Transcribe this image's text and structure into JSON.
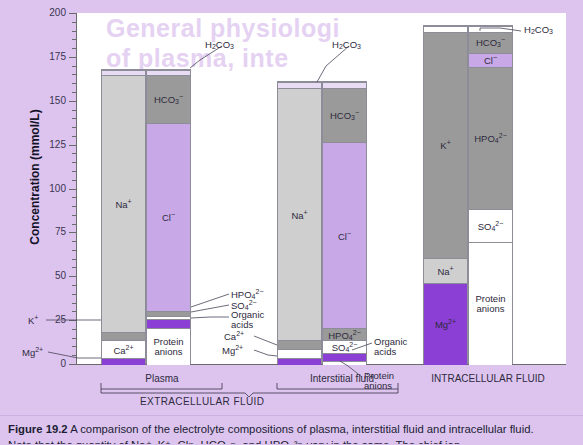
{
  "figure": {
    "caption_label": "Figure 19.2",
    "caption_text": "A comparison of the electrolyte compositions of plasma, interstitial fluid and intracellular fluid.",
    "caption_line2": "Note that the quantity of Na⁺, K⁺, Cl⁻, HCO₃⁻, and HPO₄²⁻ vary in the same. The chief ion"
  },
  "axis": {
    "y_title": "Concentration (mmol/L)",
    "y_ticks": [
      0,
      25,
      50,
      75,
      100,
      125,
      150,
      175,
      200
    ],
    "y_min": 0,
    "y_max": 200,
    "minor_step": 5
  },
  "groups": {
    "plasma": "Plasma",
    "interstitial": "Interstitial fluid",
    "extracellular": "EXTRACELLULAR FLUID",
    "intracellular": "INTRACELLULAR FLUID"
  },
  "colors": {
    "background": "#ddc4ef",
    "plot": "#ffffff",
    "na": "#cfcfcf",
    "k": "#9a9a9a",
    "ca": "#ffffff",
    "mg": "#8b3fd4",
    "cl": "#c9a8e8",
    "hco3": "#9a9a9a",
    "hpo4": "#9a9a9a",
    "so4": "#ffffff",
    "organic": "#8b3fd4",
    "protein": "#ffffff",
    "h2co3": "#e8dcf5",
    "axis": "#6b6b6b",
    "border": "#8d8d9a"
  },
  "callouts": {
    "plasma_h2co3": "H₂CO₃",
    "plasma_k": "K⁺",
    "plasma_mg": "Mg²⁺",
    "plasma_hpo4": "HPO₄²⁻",
    "plasma_so4": "SO₄²⁻",
    "plasma_organic": "Organic acids",
    "isf_h2co3": "H₂CO₃",
    "isf_ca": "Ca²⁺",
    "isf_mg": "Mg²⁺",
    "isf_organic": "Organic acids",
    "isf_protein": "Protein anions",
    "icf_h2co3": "H₂CO₃"
  },
  "chart_data": {
    "type": "bar",
    "title": "A comparison of the electrolyte compositions of plasma, interstitial fluid and intracellular fluid.",
    "xlabel": "",
    "ylabel": "Concentration (mmol/L)",
    "ylim": [
      0,
      200
    ],
    "grid": false,
    "legend": "none",
    "stacked": true,
    "categories": [
      "Plasma cations",
      "Plasma anions",
      "Interstitial fluid cations",
      "Interstitial fluid anions",
      "Intracellular fluid cations",
      "Intracellular fluid anions"
    ],
    "bars": [
      {
        "name": "Plasma cations",
        "group": "Plasma",
        "total": 168,
        "segments": [
          {
            "label": "Mg²⁺",
            "value": 4,
            "from": 0,
            "to": 4,
            "color": "#8b3fd4",
            "shown_in_bar": false
          },
          {
            "label": "Ca²⁺",
            "value": 10,
            "from": 4,
            "to": 14,
            "color": "#ffffff",
            "shown_in_bar": true
          },
          {
            "label": "K⁺",
            "value": 5,
            "from": 14,
            "to": 19,
            "color": "#9a9a9a",
            "shown_in_bar": false
          },
          {
            "label": "Na⁺",
            "value": 146,
            "from": 19,
            "to": 165,
            "color": "#cfcfcf",
            "shown_in_bar": true
          },
          {
            "label": "H₂CO₃",
            "value": 3,
            "from": 165,
            "to": 168,
            "color": "#e8dcf5",
            "shown_in_bar": false
          }
        ]
      },
      {
        "name": "Plasma anions",
        "group": "Plasma",
        "total": 168,
        "segments": [
          {
            "label": "Protein anions",
            "value": 21,
            "from": 0,
            "to": 21,
            "color": "#ffffff",
            "shown_in_bar": true
          },
          {
            "label": "Organic acids",
            "value": 5,
            "from": 21,
            "to": 26,
            "color": "#8b3fd4",
            "shown_in_bar": false
          },
          {
            "label": "SO₄²⁻",
            "value": 2,
            "from": 26,
            "to": 28,
            "color": "#ffffff",
            "shown_in_bar": false
          },
          {
            "label": "HPO₄²⁻",
            "value": 3,
            "from": 28,
            "to": 31,
            "color": "#9a9a9a",
            "shown_in_bar": false
          },
          {
            "label": "Cl⁻",
            "value": 107,
            "from": 31,
            "to": 138,
            "color": "#c9a8e8",
            "shown_in_bar": true
          },
          {
            "label": "HCO₃⁻",
            "value": 27,
            "from": 138,
            "to": 165,
            "color": "#9a9a9a",
            "shown_in_bar": true
          },
          {
            "label": "H₂CO₃",
            "value": 3,
            "from": 165,
            "to": 168,
            "color": "#e8dcf5",
            "shown_in_bar": false
          }
        ]
      },
      {
        "name": "Interstitial fluid cations",
        "group": "Interstitial fluid",
        "total": 161,
        "segments": [
          {
            "label": "Mg²⁺",
            "value": 4,
            "from": 0,
            "to": 4,
            "color": "#8b3fd4",
            "shown_in_bar": false
          },
          {
            "label": "Ca²⁺",
            "value": 5,
            "from": 4,
            "to": 9,
            "color": "#ffffff",
            "shown_in_bar": false
          },
          {
            "label": "K⁺",
            "value": 5,
            "from": 9,
            "to": 14,
            "color": "#9a9a9a",
            "shown_in_bar": true
          },
          {
            "label": "Na⁺",
            "value": 144,
            "from": 14,
            "to": 158,
            "color": "#cfcfcf",
            "shown_in_bar": true
          },
          {
            "label": "H₂CO₃",
            "value": 3,
            "from": 158,
            "to": 161,
            "color": "#e8dcf5",
            "shown_in_bar": false
          }
        ]
      },
      {
        "name": "Interstitial fluid anions",
        "group": "Interstitial fluid",
        "total": 161,
        "segments": [
          {
            "label": "Protein anions",
            "value": 2,
            "from": 0,
            "to": 2,
            "color": "#ffffff",
            "shown_in_bar": false
          },
          {
            "label": "Organic acids",
            "value": 5,
            "from": 2,
            "to": 7,
            "color": "#8b3fd4",
            "shown_in_bar": false
          },
          {
            "label": "SO₄²⁻",
            "value": 7,
            "from": 7,
            "to": 14,
            "color": "#ffffff",
            "shown_in_bar": true
          },
          {
            "label": "HPO₄²⁻",
            "value": 7,
            "from": 14,
            "to": 21,
            "color": "#9a9a9a",
            "shown_in_bar": true
          },
          {
            "label": "Cl⁻",
            "value": 106,
            "from": 21,
            "to": 127,
            "color": "#c9a8e8",
            "shown_in_bar": true
          },
          {
            "label": "HCO₃⁻",
            "value": 31,
            "from": 127,
            "to": 158,
            "color": "#9a9a9a",
            "shown_in_bar": true
          },
          {
            "label": "H₂CO₃",
            "value": 3,
            "from": 158,
            "to": 161,
            "color": "#e8dcf5",
            "shown_in_bar": false
          }
        ]
      },
      {
        "name": "Intracellular fluid cations",
        "group": "Intracellular fluid",
        "total": 193,
        "segments": [
          {
            "label": "Mg²⁺",
            "value": 47,
            "from": 0,
            "to": 47,
            "color": "#8b3fd4",
            "shown_in_bar": true
          },
          {
            "label": "Na⁺",
            "value": 14,
            "from": 47,
            "to": 61,
            "color": "#cfcfcf",
            "shown_in_bar": true
          },
          {
            "label": "K⁺",
            "value": 129,
            "from": 61,
            "to": 190,
            "color": "#9a9a9a",
            "shown_in_bar": true
          },
          {
            "label": "H₂CO₃",
            "value": 3,
            "from": 190,
            "to": 193,
            "color": "#ffffff",
            "shown_in_bar": false
          }
        ]
      },
      {
        "name": "Intracellular fluid anions",
        "group": "Intracellular fluid",
        "total": 193,
        "segments": [
          {
            "label": "Protein anions",
            "value": 70,
            "from": 0,
            "to": 70,
            "color": "#ffffff",
            "shown_in_bar": true
          },
          {
            "label": "SO₄²⁻",
            "value": 19,
            "from": 70,
            "to": 89,
            "color": "#ffffff",
            "shown_in_bar": true
          },
          {
            "label": "HPO₄²⁻",
            "value": 81,
            "from": 89,
            "to": 170,
            "color": "#9a9a9a",
            "shown_in_bar": true
          },
          {
            "label": "Cl⁻",
            "value": 8,
            "from": 170,
            "to": 178,
            "color": "#c9a8e8",
            "shown_in_bar": true
          },
          {
            "label": "HCO₃⁻",
            "value": 12,
            "from": 178,
            "to": 190,
            "color": "#9a9a9a",
            "shown_in_bar": true
          },
          {
            "label": "H₂CO₃",
            "value": 3,
            "from": 190,
            "to": 193,
            "color": "#ffffff",
            "shown_in_bar": false
          }
        ]
      }
    ]
  }
}
